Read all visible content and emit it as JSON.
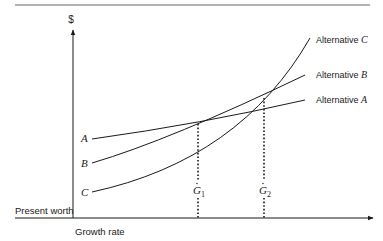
{
  "diagram": {
    "y_axis_label": "$",
    "y_axis_title": "Present worth",
    "x_axis_title": "Growth rate",
    "curves": [
      {
        "id": "A",
        "start_label": "A",
        "end_label_prefix": "Alternative ",
        "end_label_letter": "A"
      },
      {
        "id": "B",
        "start_label": "B",
        "end_label_prefix": "Alternative ",
        "end_label_letter": "B"
      },
      {
        "id": "C",
        "start_label": "C",
        "end_label_prefix": "Alternative ",
        "end_label_letter": "C"
      }
    ],
    "markers": [
      {
        "id": "G1",
        "letter": "G",
        "subscript": "1"
      },
      {
        "id": "G2",
        "letter": "G",
        "subscript": "2"
      }
    ],
    "colors": {
      "line": "#1a1a1a",
      "rule": "#555555",
      "text": "#1a1a1a"
    }
  }
}
